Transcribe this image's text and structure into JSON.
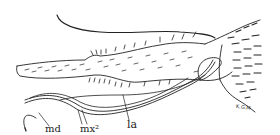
{
  "figure": {
    "labels": {
      "md": "md",
      "mx2": "mx²",
      "la": "la"
    },
    "signature": "K.G.M.",
    "colors": {
      "ink": "#222222",
      "background": "#ffffff"
    }
  }
}
